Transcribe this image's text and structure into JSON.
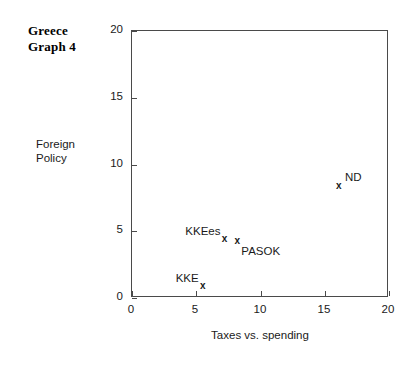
{
  "chart_data": {
    "type": "scatter",
    "title_lines": [
      "Greece",
      "Graph 4"
    ],
    "xlabel": "Taxes vs. spending",
    "ylabel": "Foreign Policy",
    "ylabel_lines": [
      "Foreign",
      "Policy"
    ],
    "xlim": [
      0,
      20
    ],
    "ylim": [
      0,
      20
    ],
    "xticks": [
      0,
      5,
      10,
      15,
      20
    ],
    "yticks": [
      0,
      5,
      10,
      15,
      20
    ],
    "xtick_labels": [
      "0",
      "5",
      "10",
      "15",
      "20"
    ],
    "ytick_labels": [
      "0",
      "5",
      "10",
      "15",
      "20"
    ],
    "grid": false,
    "legend": "none",
    "marker": "x",
    "points": [
      {
        "label": "ND",
        "x": 16.1,
        "y": 8.4,
        "label_pos": "right"
      },
      {
        "label": "KKEes",
        "x": 7.2,
        "y": 4.4,
        "label_pos": "left"
      },
      {
        "label": "PASOK",
        "x": 8.2,
        "y": 4.3,
        "label_pos": "below-right"
      },
      {
        "label": "KKE",
        "x": 5.5,
        "y": 0.9,
        "label_pos": "left"
      }
    ]
  },
  "colors": {
    "background": "#ffffff",
    "axis": "#4a4a4a",
    "text": "#1a1a1a",
    "marker": "#1a1a1a"
  }
}
